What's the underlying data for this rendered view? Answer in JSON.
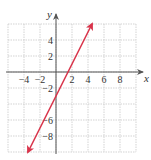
{
  "chart_data": {
    "type": "line",
    "title": "",
    "xlabel": "x",
    "ylabel": "y",
    "xlim": [
      -6,
      10
    ],
    "ylim": [
      -10,
      6
    ],
    "grid": true,
    "grid_step": 2,
    "x_ticks": [
      -4,
      -2,
      2,
      4,
      6,
      8
    ],
    "x_tick_labels": [
      "−4",
      "−2",
      "2",
      "4",
      "6",
      "8"
    ],
    "y_ticks": [
      4,
      2,
      -2,
      -6,
      -8
    ],
    "y_tick_labels": [
      "4",
      "2",
      "−2",
      "−6",
      "−8"
    ],
    "series": [
      {
        "name": "y = 2x - 3",
        "equation": "y = 2x - 3",
        "points": [
          [
            -3.5,
            -10
          ],
          [
            0,
            -3
          ],
          [
            1.5,
            0
          ],
          [
            4.5,
            6
          ]
        ],
        "arrows": "both",
        "color": "#d9334a"
      }
    ]
  },
  "colors": {
    "grid": "#c8c8c8",
    "axis": "#555555",
    "line": "#d9334a"
  }
}
